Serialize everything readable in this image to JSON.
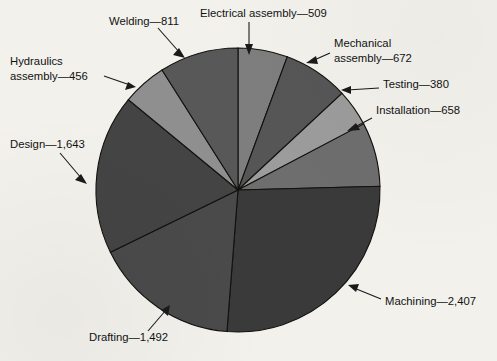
{
  "chart_data": {
    "type": "pie",
    "title": "",
    "subtitle": "",
    "xlabel": "",
    "ylabel": "",
    "total": 9028,
    "units": "hours",
    "legend_position": "none",
    "labels_style": "leader-line callouts outside slices",
    "grid": false,
    "start_angle_deg": 0,
    "direction": "clockwise",
    "categories": [
      "Electrical assembly",
      "Mechanical assembly",
      "Testing",
      "Installation",
      "Machining",
      "Drafting",
      "Design",
      "Hydraulics assembly",
      "Welding"
    ],
    "values": [
      509,
      672,
      380,
      658,
      2407,
      1492,
      1643,
      456,
      811
    ],
    "slice_colors": [
      "#7e7e7e",
      "#565656",
      "#9c9c9c",
      "#6e6e6e",
      "#3a3a3a",
      "#4a4a4a",
      "#444444",
      "#8f8f8f",
      "#585858"
    ],
    "annotations": [
      "Electrical assembly—509",
      "Welding—811",
      "Mechanical assembly—672",
      "Hydraulics assembly—456",
      "Testing—380",
      "Installation—658",
      "Design—1,643",
      "Machining—2,407",
      "Drafting—1,492"
    ]
  },
  "callouts": [
    {
      "name": "electrical-assembly",
      "lines": [
        "Electrical assembly—509"
      ],
      "text_x": 200,
      "text_y": 14,
      "anchor": "start",
      "leader": "M 249,22 L 249,49",
      "arrow": "249,55 245,44 253,44"
    },
    {
      "name": "welding",
      "lines": [
        "Welding—811"
      ],
      "text_x": 109,
      "text_y": 22,
      "anchor": "start",
      "leader": "M 158,28 L 180,53",
      "arrow": "185,58 173,55 179,48"
    },
    {
      "name": "mechanical-assembly",
      "lines": [
        "Mechanical",
        "assembly—672"
      ],
      "text_x": 334,
      "text_y": 44,
      "anchor": "start",
      "leader": "M 330,53 L 312,61",
      "arrow": "306,63 316,56 318,64"
    },
    {
      "name": "hydraulics-assembly",
      "lines": [
        "Hydraulics",
        "assembly—456"
      ],
      "text_x": 10,
      "text_y": 62,
      "anchor": "start",
      "leader": "M 104,76 L 130,85",
      "arrow": "136,87 125,90 128,82"
    },
    {
      "name": "testing",
      "lines": [
        "Testing—380"
      ],
      "text_x": 383,
      "text_y": 85,
      "anchor": "start",
      "leader": "M 379,88 L 347,90",
      "arrow": "341,90 351,86 351,94"
    },
    {
      "name": "installation",
      "lines": [
        "Installation—658"
      ],
      "text_x": 376,
      "text_y": 111,
      "anchor": "start",
      "leader": "M 372,118 L 353,128",
      "arrow": "347,131 356,123 360,130"
    },
    {
      "name": "design",
      "lines": [
        "Design—1,643"
      ],
      "text_x": 10,
      "text_y": 145,
      "anchor": "start",
      "leader": "M 60,153 L 82,179",
      "arrow": "87,184 75,180 81,174"
    },
    {
      "name": "machining",
      "lines": [
        "Machining—2,407"
      ],
      "text_x": 385,
      "text_y": 302,
      "anchor": "start",
      "leader": "M 381,299 L 354,288",
      "arrow": "348,285 359,284 356,292"
    },
    {
      "name": "drafting",
      "lines": [
        "Drafting—1,492"
      ],
      "text_x": 89,
      "text_y": 338,
      "anchor": "start",
      "leader": "M 148,331 L 166,310",
      "arrow": "170,305 168,316 161,310"
    }
  ],
  "geometry": {
    "cx": 238,
    "cy": 190,
    "r": 142,
    "background": "#f2f1ec",
    "stroke": "#12110f"
  }
}
